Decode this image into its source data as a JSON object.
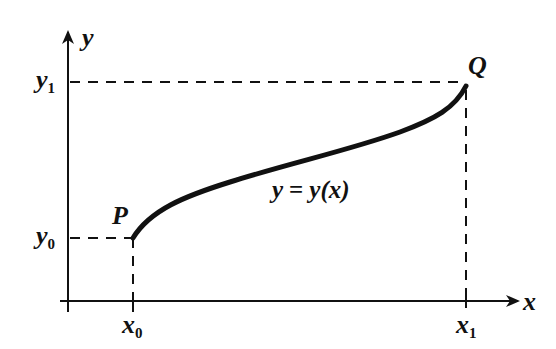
{
  "diagram": {
    "axes": {
      "x_label": "x",
      "y_label": "y"
    },
    "points": {
      "P": {
        "label": "P",
        "x_label": "x",
        "x_sub": "0",
        "y_label": "y",
        "y_sub": "0"
      },
      "Q": {
        "label": "Q",
        "x_label": "x",
        "x_sub": "1",
        "y_label": "y",
        "y_sub": "1"
      }
    },
    "curve": {
      "equation": "y = y(x)",
      "eq_lhs": "y",
      "eq_eq": "=",
      "eq_rhs": "y(x)"
    },
    "colors": {
      "ink": "#111111",
      "background": "#ffffff"
    }
  }
}
